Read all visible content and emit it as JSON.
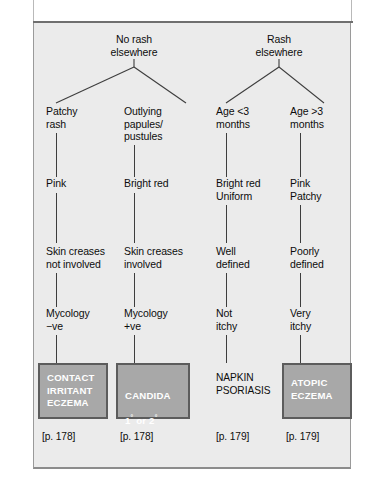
{
  "figure": {
    "type": "clinical-decision-tree",
    "background_color": "#ebebeb",
    "box_fill_color": "#a8a8a8",
    "box_border_color": "#5c5c5c",
    "box_text_color": "#ffffff",
    "line_color": "#3d3d3d"
  },
  "roots": [
    {
      "label": "No  rash\nelsewhere"
    },
    {
      "label": "Rash\nelsewhere"
    }
  ],
  "columns": [
    {
      "steps": [
        "Patchy\nrash",
        "Pink",
        "Skin creases\nnot involved",
        "Mycology\n−ve"
      ],
      "diagnosis": "CONTACT\nIRRITANT\nECZEMA",
      "boxed": true,
      "page_ref": "[p. 178]"
    },
    {
      "steps": [
        "Outlying\npapules/\npustules",
        "Bright red",
        "Skin creases\ninvolved",
        "Mycology\n+ve"
      ],
      "diagnosis": "CANDIDA",
      "diagnosis_line2_prefix": "1",
      "diagnosis_line2_mid": " or 2",
      "diagnosis_sup": "°",
      "boxed": true,
      "page_ref": "[p. 178]"
    },
    {
      "steps": [
        "Age <3\nmonths",
        "Bright red\nUniform",
        "Well\ndefined",
        "Not\nitchy"
      ],
      "diagnosis": "NAPKIN\nPSORIASIS",
      "boxed": false,
      "page_ref": "[p. 179]"
    },
    {
      "steps": [
        "Age >3\nmonths",
        "Pink\nPatchy",
        "Poorly\ndefined",
        "Very\nitchy"
      ],
      "diagnosis": "ATOPIC\nECZEMA",
      "boxed": true,
      "page_ref": "[p. 179]"
    }
  ]
}
